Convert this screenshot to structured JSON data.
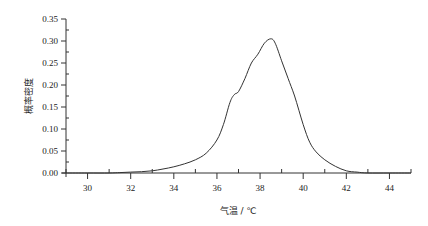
{
  "chart_data": {
    "type": "line",
    "title": "",
    "xlabel": "气温 / ℃",
    "ylabel": "概率密度",
    "xlim": [
      29,
      45
    ],
    "ylim": [
      0,
      0.35
    ],
    "x_ticks": [
      30,
      32,
      34,
      36,
      38,
      40,
      42,
      44
    ],
    "x_tick_labels": [
      "30",
      "32",
      "34",
      "36",
      "38",
      "40",
      "42",
      "44"
    ],
    "y_ticks": [
      0.0,
      0.05,
      0.1,
      0.15,
      0.2,
      0.25,
      0.3,
      0.35
    ],
    "y_tick_labels": [
      "0.00",
      "0.05",
      "0.10",
      "0.15",
      "0.20",
      "0.25",
      "0.30",
      "0.35"
    ],
    "grid": false,
    "legend": null,
    "series": [
      {
        "name": "概率密度",
        "color": "#333333",
        "x": [
          29.0,
          30.0,
          31.0,
          31.5,
          32.0,
          32.5,
          33.0,
          33.5,
          34.0,
          34.5,
          35.0,
          35.5,
          36.0,
          36.3,
          36.6,
          36.8,
          37.0,
          37.3,
          37.6,
          37.9,
          38.2,
          38.5,
          38.7,
          39.0,
          39.3,
          39.6,
          40.0,
          40.3,
          40.6,
          41.0,
          41.5,
          42.0,
          42.5,
          43.0,
          44.0,
          45.0
        ],
        "y": [
          0.0,
          0.0,
          0.0,
          0.001,
          0.002,
          0.003,
          0.005,
          0.009,
          0.014,
          0.021,
          0.03,
          0.045,
          0.075,
          0.11,
          0.16,
          0.178,
          0.185,
          0.215,
          0.25,
          0.27,
          0.295,
          0.305,
          0.295,
          0.255,
          0.215,
          0.175,
          0.11,
          0.07,
          0.048,
          0.03,
          0.015,
          0.005,
          0.002,
          0.0,
          0.0,
          0.0
        ]
      }
    ]
  },
  "labels": {
    "ylabel": "概率密度",
    "xlabel": "气温 / ℃"
  }
}
